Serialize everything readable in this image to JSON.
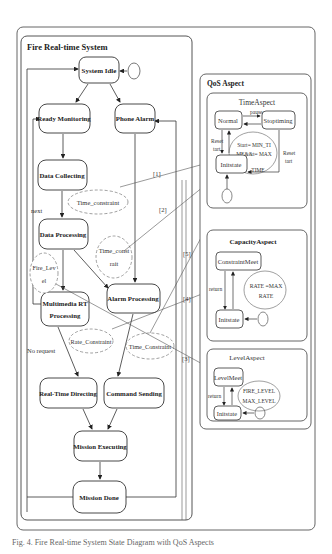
{
  "figure": {
    "outer_frame": "Fire Real-time System diagram",
    "left_panel": {
      "title": "Fire Real-time System",
      "states": {
        "system_idle": "System Idle",
        "ready_monitoring": "Ready Monitoring",
        "phone_alarm": "Phone Alarm",
        "data_collecting": "Data Collecting",
        "data_processing": "Data Processing",
        "alarm_processing": "Alarm Processing",
        "multimedia_1": "Multimedia RT",
        "multimedia_2": "Processing",
        "realtime_directing": "Real-Time Directing",
        "command_sending": "Command Sending",
        "mission_executing": "Mission Executing",
        "mission_done": "Mission Done"
      },
      "constraints": {
        "time_constraint_1": "Time_constraint",
        "time_constraint_2a": "Time_const",
        "time_constraint_2b": "rait",
        "fire_level_a": "Fire_Lev",
        "fire_level_b": "el",
        "rate_constraint": "Rate_Constraint",
        "time_constraint_3": "Time_Constraint"
      },
      "labels": {
        "next": "next",
        "no_request": "No request"
      }
    },
    "links": [
      "[1]",
      "[2]",
      "[3]",
      "[4]",
      "[5]"
    ],
    "right_panel": {
      "title": "QoS Aspect",
      "time_aspect": {
        "title": "TimeAspect",
        "normal": "Normal",
        "stoptiming": "Stoptiming",
        "initstate": "Initstate",
        "pause": "pause",
        "reset_left_1": "Reset",
        "reset_left_2": "tart",
        "reset_right_1": "Reset",
        "reset_right_2": "tart",
        "guard_1": "Start= MIN_TI",
        "guard_2": "ME&&t= MAX",
        "guard_3": "TIME"
      },
      "capacity_aspect": {
        "title": "CapacityAspect",
        "constraint_meet": "ConstraintMeet",
        "initstate": "Initstate",
        "return": "return",
        "guard_1": "RATE =MAX",
        "guard_2": "RATE"
      },
      "level_aspect": {
        "title": "LevelAspect",
        "level_meet": "LevelMeet",
        "initstate": "Initstate",
        "return": "return",
        "guard_1": "FIRE_LEVEL",
        "guard_2": "MAX_LEVEL"
      }
    },
    "caption": "Fig. 4. Fire Real-time System State Diagram with QoS Aspects"
  },
  "colors": {
    "line": "#333333",
    "frame": "#555555",
    "dashed": "#888888",
    "background": "#ffffff"
  }
}
